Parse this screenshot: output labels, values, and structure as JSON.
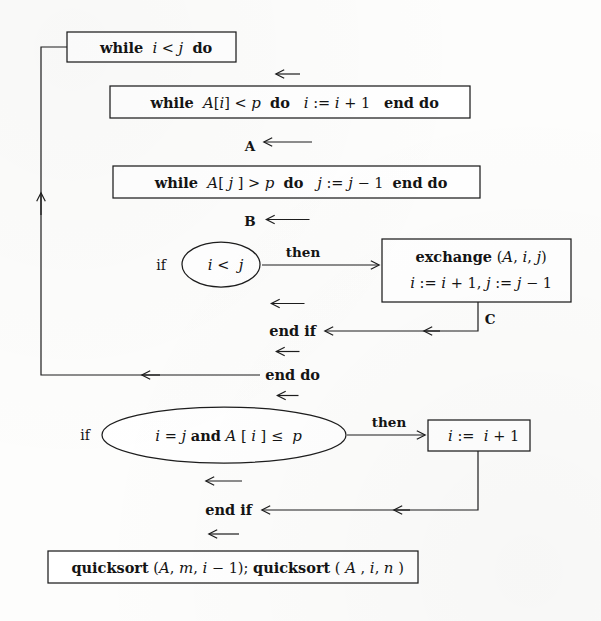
{
  "diagram": {
    "type": "flowchart",
    "background_color": "#fdfdfc",
    "ink_color": "#1d1d1d"
  },
  "nodes": [
    {
      "id": "while-i-lt-j",
      "shape": "rectangle",
      "lines": [
        {
          "segments": [
            {
              "text": "while",
              "style": "keyword"
            },
            {
              "text": " ",
              "style": "space"
            },
            {
              "text": "i",
              "style": "variable"
            },
            {
              "text": " < ",
              "style": "operator"
            },
            {
              "text": "j",
              "style": "variable"
            },
            {
              "text": "  ",
              "style": "space"
            },
            {
              "text": "do",
              "style": "keyword"
            }
          ]
        }
      ]
    },
    {
      "id": "while-A-i-lt-p",
      "shape": "rectangle",
      "lines": [
        {
          "segments": [
            {
              "text": "while",
              "style": "keyword"
            },
            {
              "text": "  ",
              "style": "space"
            },
            {
              "text": "A",
              "style": "variable"
            },
            {
              "text": "[",
              "style": "operator"
            },
            {
              "text": "i",
              "style": "variable"
            },
            {
              "text": "]",
              "style": "operator"
            },
            {
              "text": " < ",
              "style": "operator"
            },
            {
              "text": "p",
              "style": "variable"
            },
            {
              "text": "   ",
              "style": "space"
            },
            {
              "text": "do",
              "style": "keyword"
            },
            {
              "text": "   ",
              "style": "space"
            },
            {
              "text": "i",
              "style": "variable"
            },
            {
              "text": " := ",
              "style": "operator"
            },
            {
              "text": "i",
              "style": "variable"
            },
            {
              "text": " + 1",
              "style": "operator"
            },
            {
              "text": "    ",
              "style": "space"
            },
            {
              "text": "end do",
              "style": "keyword"
            }
          ]
        }
      ]
    },
    {
      "id": "while-A-j-gt-p",
      "shape": "rectangle",
      "lines": [
        {
          "segments": [
            {
              "text": "while",
              "style": "keyword"
            },
            {
              "text": "  ",
              "style": "space"
            },
            {
              "text": "A",
              "style": "variable"
            },
            {
              "text": "[ ",
              "style": "operator"
            },
            {
              "text": "j",
              "style": "variable"
            },
            {
              "text": " ]",
              "style": "operator"
            },
            {
              "text": " > ",
              "style": "operator"
            },
            {
              "text": "p",
              "style": "variable"
            },
            {
              "text": "   ",
              "style": "space"
            },
            {
              "text": "do",
              "style": "keyword"
            },
            {
              "text": "   ",
              "style": "space"
            },
            {
              "text": "j",
              "style": "variable"
            },
            {
              "text": " := ",
              "style": "operator"
            },
            {
              "text": "j",
              "style": "variable"
            },
            {
              "text": " − 1",
              "style": "operator"
            },
            {
              "text": "   ",
              "style": "space"
            },
            {
              "text": "end do",
              "style": "keyword"
            }
          ]
        }
      ]
    },
    {
      "id": "cond-i-lt-j",
      "shape": "ellipse",
      "prefix_label": "if",
      "lines": [
        {
          "segments": [
            {
              "text": "i",
              "style": "variable"
            },
            {
              "text": " < ",
              "style": "operator"
            },
            {
              "text": " j",
              "style": "variable"
            }
          ]
        }
      ]
    },
    {
      "id": "exchange-box",
      "shape": "rectangle",
      "lines": [
        {
          "segments": [
            {
              "text": "exchange",
              "style": "keyword"
            },
            {
              "text": " (",
              "style": "operator"
            },
            {
              "text": "A",
              "style": "variable"
            },
            {
              "text": ", ",
              "style": "operator"
            },
            {
              "text": "i",
              "style": "variable"
            },
            {
              "text": ", ",
              "style": "operator"
            },
            {
              "text": "j",
              "style": "variable"
            },
            {
              "text": ")",
              "style": "operator"
            }
          ]
        },
        {
          "segments": [
            {
              "text": "i",
              "style": "variable"
            },
            {
              "text": " := ",
              "style": "operator"
            },
            {
              "text": "i",
              "style": "variable"
            },
            {
              "text": " + 1, ",
              "style": "operator"
            },
            {
              "text": "j",
              "style": "variable"
            },
            {
              "text": " := ",
              "style": "operator"
            },
            {
              "text": "j",
              "style": "variable"
            },
            {
              "text": " − 1",
              "style": "operator"
            }
          ]
        }
      ]
    },
    {
      "id": "end-if-upper",
      "shape": "text",
      "lines": [
        {
          "segments": [
            {
              "text": "end if",
              "style": "keyword"
            }
          ]
        }
      ]
    },
    {
      "id": "end-do",
      "shape": "text",
      "lines": [
        {
          "segments": [
            {
              "text": "end do",
              "style": "keyword"
            }
          ]
        }
      ]
    },
    {
      "id": "cond-i-eq-j",
      "shape": "ellipse",
      "prefix_label": "if",
      "lines": [
        {
          "segments": [
            {
              "text": "i",
              "style": "variable"
            },
            {
              "text": " = ",
              "style": "operator"
            },
            {
              "text": "j",
              "style": "variable"
            },
            {
              "text": " and ",
              "style": "keyword"
            },
            {
              "text": "A",
              "style": "variable"
            },
            {
              "text": " [ ",
              "style": "operator"
            },
            {
              "text": "i",
              "style": "variable"
            },
            {
              "text": " ] ≤  ",
              "style": "operator"
            },
            {
              "text": "p",
              "style": "variable"
            }
          ]
        }
      ]
    },
    {
      "id": "incr-i-box",
      "shape": "rectangle",
      "lines": [
        {
          "segments": [
            {
              "text": "i",
              "style": "variable"
            },
            {
              "text": " := ",
              "style": "operator"
            },
            {
              "text": " i",
              "style": "variable"
            },
            {
              "text": " + 1",
              "style": "operator"
            }
          ]
        }
      ]
    },
    {
      "id": "end-if-lower",
      "shape": "text",
      "lines": [
        {
          "segments": [
            {
              "text": "end if",
              "style": "keyword"
            }
          ]
        }
      ]
    },
    {
      "id": "quicksort-calls",
      "shape": "rectangle",
      "lines": [
        {
          "segments": [
            {
              "text": "quicksort",
              "style": "keyword"
            },
            {
              "text": " (",
              "style": "operator"
            },
            {
              "text": "A",
              "style": "variable"
            },
            {
              "text": ", ",
              "style": "operator"
            },
            {
              "text": "m",
              "style": "variable"
            },
            {
              "text": ", ",
              "style": "operator"
            },
            {
              "text": "i",
              "style": "variable"
            },
            {
              "text": " − 1); ",
              "style": "operator"
            },
            {
              "text": "quicksort",
              "style": "keyword"
            },
            {
              "text": " ( ",
              "style": "operator"
            },
            {
              "text": "A",
              "style": "variable"
            },
            {
              "text": " , ",
              "style": "operator"
            },
            {
              "text": "i",
              "style": "variable"
            },
            {
              "text": ", ",
              "style": "operator"
            },
            {
              "text": "n",
              "style": "variable"
            },
            {
              "text": " )",
              "style": "operator"
            }
          ]
        }
      ]
    }
  ],
  "node_text": {
    "box1": "while  i < j  do",
    "box2": "while  A[i] < p   do   i := i + 1    end do",
    "box3": "while  A[ j ] > p   do   j := j − 1   end do",
    "cond1": "i < j",
    "exchange_line1": "exchange (A, i, j)",
    "exchange_line2": "i := i + 1, j := j − 1",
    "end_if_upper": "end if",
    "end_do": "end do",
    "cond2": "i = j and A [ i ] ≤  p",
    "incr_i": "i :=  i + 1",
    "end_if_lower": "end if",
    "quicksort": "quicksort (A, m, i − 1); quicksort ( A , i, n )"
  },
  "edge_labels": {
    "tag_a": "A",
    "tag_b": "B",
    "tag_c": "C",
    "then_upper": "then",
    "then_lower": "then",
    "if_upper": "if",
    "if_lower": "if"
  }
}
